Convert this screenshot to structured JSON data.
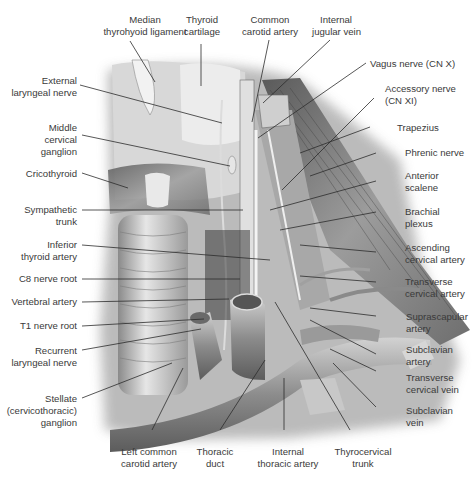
{
  "figure": {
    "labels_top": [
      {
        "id": "median-thyrohyoid-ligament",
        "text": [
          "Median",
          "thyrohyoid ligament"
        ]
      },
      {
        "id": "thyroid-cartilage",
        "text": [
          "Thyroid",
          "cartilage"
        ]
      },
      {
        "id": "common-carotid-artery",
        "text": [
          "Common",
          "carotid artery"
        ]
      },
      {
        "id": "internal-jugular-vein",
        "text": [
          "Internal",
          "jugular vein"
        ]
      }
    ],
    "labels_left": [
      {
        "id": "external-laryngeal-nerve",
        "text": [
          "External",
          "laryngeal nerve"
        ]
      },
      {
        "id": "middle-cervical-ganglion",
        "text": [
          "Middle",
          "cervical",
          "ganglion"
        ]
      },
      {
        "id": "cricothyroid",
        "text": [
          "Cricothyroid"
        ]
      },
      {
        "id": "sympathetic-trunk",
        "text": [
          "Sympathetic",
          "trunk"
        ]
      },
      {
        "id": "inferior-thyroid-artery",
        "text": [
          "Inferior",
          "thyroid artery"
        ]
      },
      {
        "id": "c8-nerve-root",
        "text": [
          "C8 nerve root"
        ]
      },
      {
        "id": "vertebral-artery",
        "text": [
          "Vertebral artery"
        ]
      },
      {
        "id": "t1-nerve-root",
        "text": [
          "T1 nerve root"
        ]
      },
      {
        "id": "recurrent-laryngeal-nerve",
        "text": [
          "Recurrent",
          "laryngeal nerve"
        ]
      },
      {
        "id": "stellate-ganglion",
        "text": [
          "Stellate",
          "(cervicothoracic)",
          "ganglion"
        ]
      }
    ],
    "labels_right": [
      {
        "id": "vagus-nerve",
        "text": [
          "Vagus nerve (CN X)"
        ]
      },
      {
        "id": "accessory-nerve",
        "text": [
          "Accessory nerve",
          "(CN XI)"
        ]
      },
      {
        "id": "trapezius",
        "text": [
          "Trapezius"
        ]
      },
      {
        "id": "phrenic-nerve",
        "text": [
          "Phrenic nerve"
        ]
      },
      {
        "id": "anterior-scalene",
        "text": [
          "Anterior",
          "scalene"
        ]
      },
      {
        "id": "brachial-plexus",
        "text": [
          "Brachial",
          "plexus"
        ]
      },
      {
        "id": "ascending-cervical-artery",
        "text": [
          "Ascending",
          "cervical artery"
        ]
      },
      {
        "id": "transverse-cervical-artery",
        "text": [
          "Transverse",
          "cervical artery"
        ]
      },
      {
        "id": "suprascapular-artery",
        "text": [
          "Suprascapular",
          "artery"
        ]
      },
      {
        "id": "subclavian-artery",
        "text": [
          "Subclavian",
          "artery"
        ]
      },
      {
        "id": "transverse-cervical-vein",
        "text": [
          "Transverse",
          "cervical vein"
        ]
      },
      {
        "id": "subclavian-vein",
        "text": [
          "Subclavian",
          "vein"
        ]
      }
    ],
    "labels_bottom": [
      {
        "id": "left-common-carotid-artery",
        "text": [
          "Left common",
          "carotid artery"
        ]
      },
      {
        "id": "thoracic-duct",
        "text": [
          "Thoracic",
          "duct"
        ]
      },
      {
        "id": "internal-thoracic-artery",
        "text": [
          "Internal",
          "thoracic artery"
        ]
      },
      {
        "id": "thyrocervical-trunk",
        "text": [
          "Thyrocervical",
          "trunk"
        ]
      }
    ]
  }
}
